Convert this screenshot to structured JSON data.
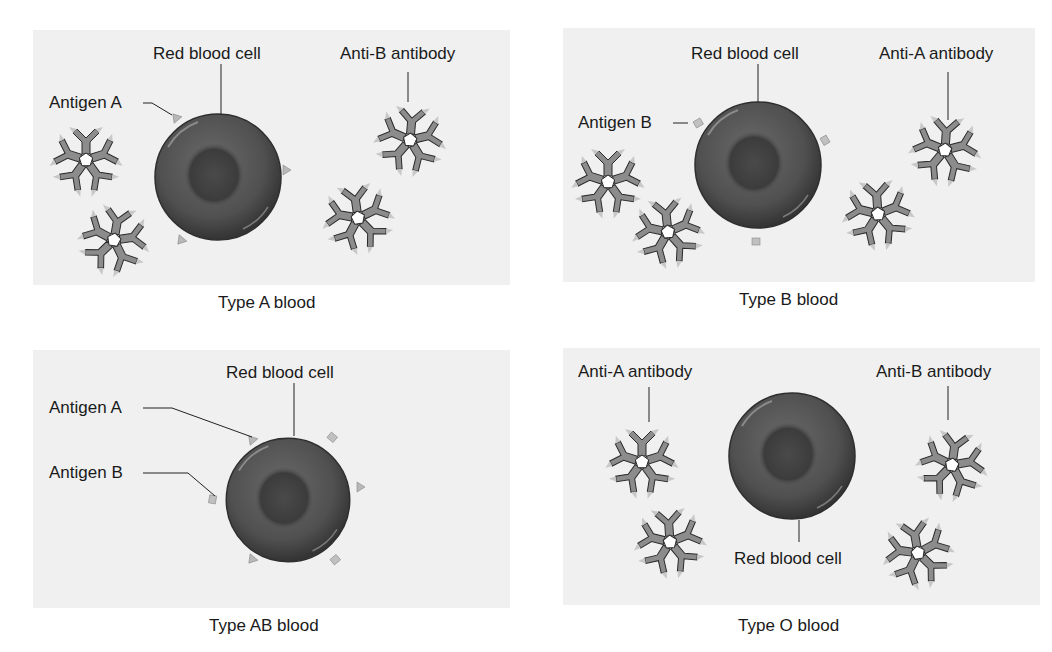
{
  "colors": {
    "panel_bg": "#f0f0f0",
    "cell_dark": "#3a3a3a",
    "cell_mid": "#5e5e5e",
    "antibody_fill": "#8c8c8c",
    "antibody_tip": "#c8c8c8",
    "leader_line": "#222222"
  },
  "panels": [
    {
      "id": "type-a",
      "caption": "Type A blood",
      "labels": {
        "rbc": "Red blood cell",
        "antigen_a": "Antigen A",
        "antibody": "Anti-B antibody"
      }
    },
    {
      "id": "type-b",
      "caption": "Type B blood",
      "labels": {
        "rbc": "Red blood cell",
        "antigen_b": "Antigen B",
        "antibody": "Anti-A antibody"
      }
    },
    {
      "id": "type-ab",
      "caption": "Type AB blood",
      "labels": {
        "rbc": "Red blood cell",
        "antigen_a": "Antigen A",
        "antigen_b": "Antigen B"
      }
    },
    {
      "id": "type-o",
      "caption": "Type O blood",
      "labels": {
        "rbc": "Red blood cell",
        "antibody_a": "Anti-A antibody",
        "antibody_b": "Anti-B antibody"
      }
    }
  ]
}
